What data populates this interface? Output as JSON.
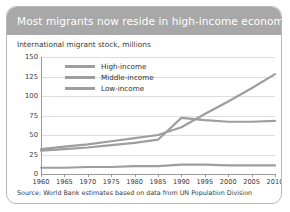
{
  "card": {
    "title": "Most migrants now reside in high-income economies",
    "subtitle": "International migrant stock, millions",
    "source": "Source: World Bank estimates based on data from UN Population Division",
    "band_color": "#a8a8a8",
    "border_color": "#b9b9b9",
    "line_color": "#9e9e9e"
  },
  "chart_data": {
    "type": "line",
    "title": "Most migrants now reside in high-income economies",
    "subtitle": "International migrant stock, millions",
    "xlabel": "",
    "ylabel": "International migrant stock, millions",
    "x": [
      1960,
      1965,
      1970,
      1975,
      1980,
      1985,
      1990,
      1995,
      2000,
      2005,
      2010
    ],
    "categories": [
      "1960",
      "1965",
      "1970",
      "1975",
      "1980",
      "1985",
      "1990",
      "1995",
      "2000",
      "2005",
      "2010"
    ],
    "yticks": [
      0,
      25,
      50,
      75,
      100,
      125,
      150
    ],
    "ylim": [
      0,
      150
    ],
    "xlim": [
      1960,
      2010
    ],
    "grid": true,
    "legend_position": "top-left",
    "series": [
      {
        "name": "High-income",
        "color": "#9e9e9e",
        "values": [
          32,
          35,
          38,
          42,
          46,
          50,
          60,
          77,
          93,
          110,
          128
        ]
      },
      {
        "name": "Middle-income",
        "color": "#9e9e9e",
        "values": [
          30,
          32,
          34,
          37,
          40,
          44,
          72,
          69,
          67,
          67,
          68
        ]
      },
      {
        "name": "Low-income",
        "color": "#9e9e9e",
        "values": [
          8,
          8,
          9,
          9,
          10,
          10,
          12,
          12,
          11,
          11,
          11
        ]
      }
    ]
  }
}
